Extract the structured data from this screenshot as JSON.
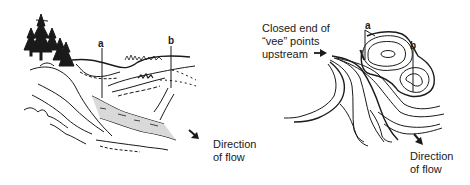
{
  "figure": {
    "left_panel": {
      "title": "landscape sketch",
      "point_a_label": "a",
      "point_b_label": "b",
      "flow_label_line1": "Direction",
      "flow_label_line2": "of flow"
    },
    "right_panel": {
      "title": "topographic contour map",
      "annotation_line1": "Closed end of",
      "annotation_line2": "“vee” points",
      "annotation_line3": "upstream",
      "point_a_label": "a",
      "point_b_label": "b",
      "flow_label_line1": "Direction",
      "flow_label_line2": "of flow"
    },
    "colors": {
      "ink": "#1a1a1a",
      "water": "#d9d9d9",
      "background": "#ffffff"
    }
  }
}
